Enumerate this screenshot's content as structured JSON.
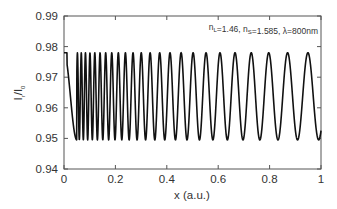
{
  "chart_data": {
    "type": "line",
    "title": "",
    "xlabel": "x (a.u.)",
    "ylabel": "I_r/I_0",
    "ylabel_parts": {
      "main": "I",
      "sub1": "r",
      "slash": "/I",
      "sub2": "0"
    },
    "xlim": [
      0,
      1
    ],
    "ylim": [
      0.94,
      0.99
    ],
    "x_ticks": [
      0,
      0.2,
      0.4,
      0.6,
      0.8,
      1
    ],
    "x_tick_labels": [
      "0",
      "0.2",
      "0.4",
      "0.6",
      "0.8",
      "1"
    ],
    "y_ticks": [
      0.94,
      0.95,
      0.96,
      0.97,
      0.98,
      0.99
    ],
    "y_tick_labels": [
      "0.94",
      "0.95",
      "0.96",
      "0.97",
      "0.98",
      "0.99"
    ],
    "grid": false,
    "legend": null,
    "annotation": {
      "text": "n_L=1.46, n_S=1.585, λ=800nm",
      "parts": [
        {
          "t": "n",
          "sub": "L"
        },
        {
          "t": "=1.46, "
        },
        {
          "t": "n",
          "sub": "S"
        },
        {
          "t": "=1.585, λ=800nm"
        }
      ],
      "position": "top-right"
    },
    "series": [
      {
        "name": "I_r/I_0",
        "color": "#111111",
        "description": "Chirped oscillation between ~0.950 and ~0.978; starts at 0.978 at x=0, first minimum ~0.950 near x=0.05, oscillation frequency decreases with x; last maxima near x=0.75 and x=0.87 (0.978); ends ~0.954 at x=1",
        "min": 0.9495,
        "max": 0.978,
        "x": [
          0,
          0.02,
          0.05,
          0.075,
          0.1,
          0.2,
          0.3,
          0.4,
          0.5,
          0.6,
          0.68,
          0.75,
          0.8,
          0.87,
          0.93,
          1.0
        ],
        "y": [
          0.978,
          0.975,
          0.95,
          0.978,
          0.95,
          0.964,
          0.964,
          0.964,
          0.964,
          0.964,
          0.95,
          0.978,
          0.95,
          0.978,
          0.966,
          0.954
        ]
      }
    ]
  },
  "plot_area": {
    "left": 64,
    "right": 321,
    "top": 16,
    "bottom": 169
  }
}
